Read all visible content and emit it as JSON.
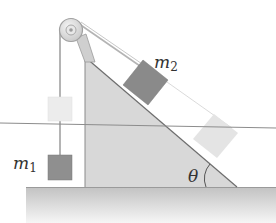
{
  "diagram": {
    "type": "physics-atwood-incline",
    "labels": {
      "m1_symbol": "m",
      "m1_subscript": "1",
      "m2_symbol": "m",
      "m2_subscript": "2",
      "angle": "θ"
    },
    "colors": {
      "background": "#ffffff",
      "incline_fill": "#d6d6d6",
      "incline_edge": "#8a8a8a",
      "block_solid": "#8f8f8f",
      "block_ghost": "#e6e6e6",
      "rope": "#b8b8b8",
      "pulley_fill": "#dcdcdc",
      "pulley_edge": "#a0a0a0",
      "ground_top": "#c4c4c4",
      "ground_bottom": "#f4f4f4",
      "reference_line": "#8c8c8c",
      "label_text": "#333333"
    }
  }
}
